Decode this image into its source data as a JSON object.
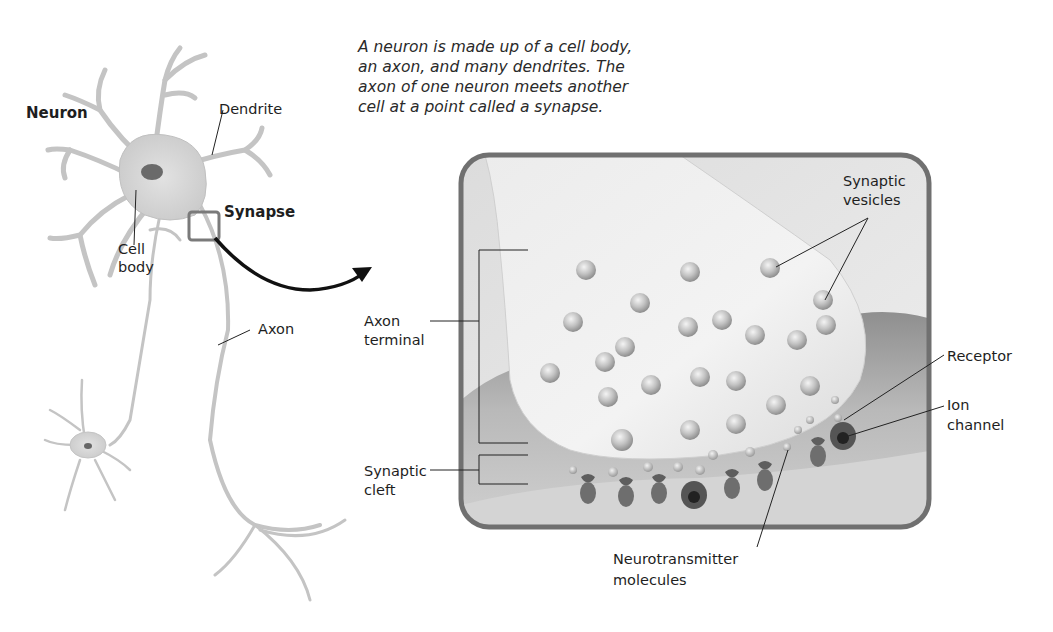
{
  "figure": {
    "caption_lines": [
      "A neuron is made up of a cell body,",
      "an axon, and many dendrites. The",
      "axon of one neuron meets another",
      "cell at a point called a synapse."
    ],
    "neuron_panel": {
      "title": "Neuron",
      "labels": {
        "dendrite": "Dendrite",
        "cell_body_line1": "Cell",
        "cell_body_line2": "body",
        "synapse": "Synapse",
        "axon": "Axon"
      }
    },
    "synapse_panel": {
      "labels": {
        "axon_terminal_line1": "Axon",
        "axon_terminal_line2": "terminal",
        "synaptic_cleft_line1": "Synaptic",
        "synaptic_cleft_line2": "cleft",
        "synaptic_vesicles_line1": "Synaptic",
        "synaptic_vesicles_line2": "vesicles",
        "receptor": "Receptor",
        "ion_channel_line1": "Ion",
        "ion_channel_line2": "channel",
        "neurotransmitter_line1": "Neurotransmitter",
        "neurotransmitter_line2": "molecules"
      },
      "colors": {
        "frame": "#6f6f6f",
        "background": "#e9e9e9",
        "terminal": "#f1f1f1",
        "postsynaptic": "#a8a8a8",
        "vesicle": "#bdbdbd",
        "receptor": "#5a5a5a"
      }
    }
  }
}
